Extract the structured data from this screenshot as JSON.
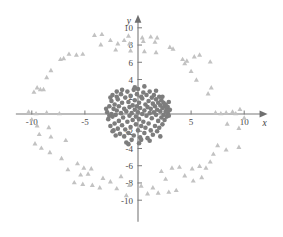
{
  "chart_data": {
    "type": "scatter",
    "title": "",
    "subtitle": "",
    "xlabel": "x",
    "ylabel": "y",
    "xlim": [
      -11.5,
      12.2
    ],
    "ylim": [
      -12.5,
      11.5
    ],
    "grid": false,
    "legend_position": "none",
    "axes": {
      "origin_label": "",
      "x_ticks": [
        -10,
        -5,
        5,
        10
      ],
      "x_tick_labels": [
        "-10",
        "-5",
        "5",
        "10"
      ],
      "y_ticks": [
        -10,
        -8,
        -6,
        -4,
        -2,
        2,
        4,
        6,
        8,
        10
      ],
      "y_tick_labels": [
        "-10",
        "-8",
        "-6",
        "-4",
        "-2",
        "2",
        "4",
        "6",
        "8",
        "10"
      ],
      "x_axis_name": "x",
      "y_axis_name": "y",
      "arrows": "both-positive-ends"
    },
    "series": [
      {
        "name": "inner-cluster",
        "marker": "circle",
        "color": "#7d7d7d",
        "size": 4.6,
        "points": [
          [
            -2.9,
            0.2
          ],
          [
            -2.8,
            -0.6
          ],
          [
            -2.7,
            0.9
          ],
          [
            -2.6,
            -1.4
          ],
          [
            -2.5,
            0.0
          ],
          [
            -2.5,
            1.5
          ],
          [
            -2.4,
            -0.3
          ],
          [
            -2.4,
            -2.0
          ],
          [
            -2.3,
            0.6
          ],
          [
            -2.2,
            1.1
          ],
          [
            -2.2,
            -1.1
          ],
          [
            -2.1,
            -0.1
          ],
          [
            -2.0,
            2.0
          ],
          [
            -2.0,
            0.4
          ],
          [
            -1.9,
            -1.7
          ],
          [
            -1.9,
            1.7
          ],
          [
            -1.8,
            -0.8
          ],
          [
            -1.8,
            0.9
          ],
          [
            -1.7,
            -2.3
          ],
          [
            -1.6,
            0.1
          ],
          [
            -1.6,
            2.3
          ],
          [
            -1.5,
            -1.3
          ],
          [
            -1.5,
            1.3
          ],
          [
            -1.4,
            -0.4
          ],
          [
            -1.3,
            0.6
          ],
          [
            -1.3,
            -2.6
          ],
          [
            -1.2,
            1.9
          ],
          [
            -1.2,
            -1.8
          ],
          [
            -1.1,
            0.3
          ],
          [
            -1.0,
            -0.9
          ],
          [
            -1.0,
            2.6
          ],
          [
            -0.9,
            1.4
          ],
          [
            -0.9,
            -2.2
          ],
          [
            -0.8,
            -0.2
          ],
          [
            -0.8,
            0.8
          ],
          [
            -0.7,
            -1.5
          ],
          [
            -0.7,
            2.1
          ],
          [
            -0.6,
            0.1
          ],
          [
            -0.6,
            -3.0
          ],
          [
            -0.5,
            1.0
          ],
          [
            -0.5,
            -0.7
          ],
          [
            -0.4,
            2.8
          ],
          [
            -0.4,
            -2.5
          ],
          [
            -0.3,
            0.5
          ],
          [
            -0.3,
            1.6
          ],
          [
            -0.2,
            -1.2
          ],
          [
            -0.2,
            -0.3
          ],
          [
            -0.1,
            2.3
          ],
          [
            -0.1,
            0.9
          ],
          [
            0.0,
            -1.9
          ],
          [
            0.0,
            0.2
          ],
          [
            0.0,
            2.9
          ],
          [
            0.1,
            -0.6
          ],
          [
            0.1,
            1.3
          ],
          [
            0.2,
            -2.7
          ],
          [
            0.2,
            0.7
          ],
          [
            0.3,
            2.0
          ],
          [
            0.3,
            -1.4
          ],
          [
            0.4,
            0.0
          ],
          [
            0.4,
            1.8
          ],
          [
            0.5,
            -0.9
          ],
          [
            0.5,
            2.5
          ],
          [
            0.6,
            -2.2
          ],
          [
            0.6,
            0.4
          ],
          [
            0.7,
            1.1
          ],
          [
            0.7,
            -1.6
          ],
          [
            0.8,
            2.2
          ],
          [
            0.8,
            -0.2
          ],
          [
            0.9,
            0.8
          ],
          [
            0.9,
            -2.8
          ],
          [
            1.0,
            1.5
          ],
          [
            1.0,
            -1.1
          ],
          [
            1.1,
            0.1
          ],
          [
            1.1,
            2.6
          ],
          [
            1.2,
            -1.9
          ],
          [
            1.2,
            0.6
          ],
          [
            1.3,
            1.9
          ],
          [
            1.3,
            -0.5
          ],
          [
            1.4,
            -2.4
          ],
          [
            1.4,
            1.2
          ],
          [
            1.5,
            0.2
          ],
          [
            1.5,
            2.2
          ],
          [
            1.6,
            -1.4
          ],
          [
            1.6,
            0.9
          ],
          [
            1.7,
            -0.1
          ],
          [
            1.7,
            1.7
          ],
          [
            1.8,
            -2.0
          ],
          [
            1.8,
            0.5
          ],
          [
            1.9,
            1.3
          ],
          [
            1.9,
            -0.8
          ],
          [
            2.0,
            2.0
          ],
          [
            2.0,
            -1.6
          ],
          [
            2.1,
            0.3
          ],
          [
            2.1,
            1.0
          ],
          [
            2.2,
            -0.4
          ],
          [
            2.2,
            1.6
          ],
          [
            2.3,
            -1.2
          ],
          [
            2.3,
            0.7
          ],
          [
            2.4,
            1.3
          ],
          [
            2.4,
            -0.1
          ],
          [
            2.5,
            0.9
          ],
          [
            2.5,
            -0.7
          ],
          [
            2.6,
            0.3
          ],
          [
            2.6,
            1.1
          ],
          [
            2.7,
            -0.3
          ],
          [
            2.7,
            0.6
          ],
          [
            2.8,
            0.1
          ],
          [
            2.8,
            0.8
          ],
          [
            2.9,
            0.4
          ],
          [
            2.9,
            -0.2
          ],
          [
            -2.6,
            1.9
          ],
          [
            -2.3,
            -1.9
          ],
          [
            -1.1,
            -3.3
          ],
          [
            0.1,
            -3.4
          ],
          [
            -0.3,
            3.1
          ],
          [
            1.1,
            -3.1
          ],
          [
            -2.1,
            -2.5
          ],
          [
            2.1,
            -2.6
          ],
          [
            2.3,
            2.0
          ],
          [
            -2.0,
            2.6
          ],
          [
            0.6,
            3.2
          ],
          [
            -1.5,
            2.8
          ],
          [
            1.7,
            2.7
          ],
          [
            -0.9,
            -3.5
          ],
          [
            0.3,
            -3.0
          ],
          [
            -2.7,
            -0.2
          ],
          [
            3.0,
            0.5
          ],
          [
            -3.0,
            0.6
          ],
          [
            2.9,
            1.4
          ],
          [
            -2.4,
            2.2
          ]
        ]
      },
      {
        "name": "outer-ring",
        "marker": "triangle",
        "color": "#c2c2c2",
        "size": 5.0,
        "points": [
          [
            -0.9,
            9.1
          ],
          [
            -1.3,
            8.6
          ],
          [
            0.4,
            8.9
          ],
          [
            1.2,
            9.0
          ],
          [
            1.8,
            8.9
          ],
          [
            -0.8,
            8.2
          ],
          [
            0.5,
            8.5
          ],
          [
            1.6,
            8.4
          ],
          [
            -1.9,
            8.2
          ],
          [
            -2.6,
            8.6
          ],
          [
            -3.4,
            9.3
          ],
          [
            -4.1,
            9.2
          ],
          [
            -0.7,
            7.4
          ],
          [
            0.6,
            7.3
          ],
          [
            1.7,
            7.2
          ],
          [
            -2.1,
            7.5
          ],
          [
            -3.5,
            8.1
          ],
          [
            3.0,
            7.8
          ],
          [
            3.3,
            7.6
          ],
          [
            -5.2,
            7.0
          ],
          [
            -5.8,
            6.9
          ],
          [
            -6.5,
            7.0
          ],
          [
            -7.0,
            6.5
          ],
          [
            -7.3,
            6.4
          ],
          [
            5.3,
            6.7
          ],
          [
            5.8,
            6.9
          ],
          [
            4.2,
            6.4
          ],
          [
            4.6,
            6.2
          ],
          [
            4.4,
            5.9
          ],
          [
            6.8,
            6.1
          ],
          [
            -8.2,
            5.1
          ],
          [
            -8.6,
            4.3
          ],
          [
            5.0,
            5.0
          ],
          [
            5.5,
            4.0
          ],
          [
            -9.5,
            3.1
          ],
          [
            -9.2,
            2.9
          ],
          [
            -9.8,
            2.6
          ],
          [
            -8.9,
            2.9
          ],
          [
            6.9,
            3.1
          ],
          [
            6.6,
            2.4
          ],
          [
            -10.3,
            0.3
          ],
          [
            -9.6,
            0.1
          ],
          [
            -8.6,
            0.2
          ],
          [
            -7.4,
            0.1
          ],
          [
            7.3,
            0.2
          ],
          [
            7.8,
            0.1
          ],
          [
            8.3,
            0.2
          ],
          [
            8.9,
            0.3
          ],
          [
            9.6,
            0.6
          ],
          [
            9.2,
            0.1
          ],
          [
            -9.5,
            -1.3
          ],
          [
            -8.4,
            -1.5
          ],
          [
            -9.3,
            -2.3
          ],
          [
            -8.2,
            -2.6
          ],
          [
            8.4,
            -1.1
          ],
          [
            9.5,
            -1.6
          ],
          [
            -9.7,
            -3.4
          ],
          [
            -9.1,
            -3.9
          ],
          [
            7.5,
            -3.6
          ],
          [
            8.3,
            -4.1
          ],
          [
            -8.3,
            -4.4
          ],
          [
            9.5,
            -3.8
          ],
          [
            -5.7,
            -5.7
          ],
          [
            -5.1,
            -6.2
          ],
          [
            -4.4,
            -6.3
          ],
          [
            -4.7,
            -6.9
          ],
          [
            -5.4,
            -7.0
          ],
          [
            3.2,
            -6.2
          ],
          [
            3.9,
            -6.1
          ],
          [
            5.1,
            -6.3
          ],
          [
            5.8,
            -6.0
          ],
          [
            6.4,
            -6.2
          ],
          [
            -3.3,
            -7.4
          ],
          [
            -2.6,
            -7.8
          ],
          [
            -6.0,
            -7.9
          ],
          [
            -5.2,
            -8.1
          ],
          [
            -4.3,
            -8.2
          ],
          [
            -3.6,
            -8.5
          ],
          [
            -2.0,
            -8.6
          ],
          [
            -0.8,
            -8.2
          ],
          [
            0.3,
            -8.3
          ],
          [
            1.4,
            -8.5
          ],
          [
            2.6,
            -7.5
          ],
          [
            4.4,
            -7.1
          ],
          [
            5.2,
            -7.7
          ],
          [
            0.9,
            -9.2
          ],
          [
            1.9,
            -9.1
          ],
          [
            2.9,
            -9.0
          ],
          [
            -1.1,
            -9.4
          ],
          [
            6.0,
            -7.3
          ],
          [
            -6.6,
            -6.4
          ],
          [
            6.8,
            -5.5
          ],
          [
            -7.2,
            -5.1
          ],
          [
            2.2,
            -6.6
          ],
          [
            -1.6,
            -7.2
          ],
          [
            3.6,
            -8.8
          ],
          [
            -6.8,
            -3.0
          ],
          [
            7.1,
            -4.6
          ],
          [
            -10.0,
            -0.6
          ],
          [
            10.0,
            -0.4
          ]
        ]
      }
    ]
  }
}
